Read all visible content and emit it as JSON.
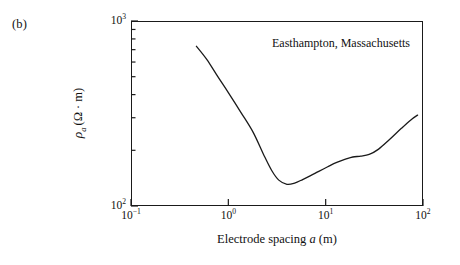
{
  "figure": {
    "panel_label": "(b)",
    "annotation": "Easthampton, Massachusetts"
  },
  "axes": {
    "x_title_prefix": "Electrode spacing ",
    "x_title_symbol": "a",
    "x_title_units": " (m)",
    "y_symbol": "ρ",
    "y_subscript": "a",
    "y_units": "(Ω · m)",
    "x_tick_labels": [
      "10",
      "10",
      "10",
      "10"
    ],
    "x_tick_exponents": [
      "−1",
      "0",
      "1",
      "2"
    ],
    "y_tick_labels": [
      "10",
      "10"
    ],
    "y_tick_exponents": [
      "3",
      "2"
    ]
  },
  "chart_data": {
    "type": "line",
    "title": "",
    "subtitle": "",
    "xlabel": "Electrode spacing a (m)",
    "ylabel": "ρa (Ω · m)",
    "xscale": "log",
    "yscale": "log",
    "xlim": [
      0.1,
      100
    ],
    "ylim": [
      100,
      1000
    ],
    "grid": false,
    "legend": false,
    "annotations": [
      {
        "text": "Easthampton, Massachusetts",
        "x": 12,
        "y": 760
      },
      {
        "text": "(b)",
        "x": null,
        "y": null,
        "placement": "outside-top-left"
      }
    ],
    "x_major_ticks": [
      0.1,
      1,
      10,
      100
    ],
    "x_major_tick_labels": [
      "10⁻¹",
      "10⁰",
      "10¹",
      "10²"
    ],
    "y_major_ticks": [
      100,
      1000
    ],
    "y_major_tick_labels": [
      "10²",
      "10³"
    ],
    "series": [
      {
        "name": "Apparent resistivity sounding curve",
        "color": "#1a1a1a",
        "linewidth": 1.3,
        "x": [
          0.47,
          0.6,
          0.78,
          1.0,
          1.35,
          1.8,
          2.3,
          2.8,
          3.3,
          4.0,
          4.8,
          5.8,
          7.0,
          8.5,
          10.5,
          13.0,
          16.0,
          19.0,
          23.0,
          28.0,
          35.0,
          45.0,
          60.0,
          75.0,
          88.0
        ],
        "y": [
          730,
          620,
          500,
          410,
          320,
          250,
          190,
          155,
          138,
          131,
          133,
          139,
          146,
          154,
          163,
          172,
          179,
          184,
          186,
          190,
          203,
          228,
          263,
          292,
          310
        ]
      }
    ]
  }
}
